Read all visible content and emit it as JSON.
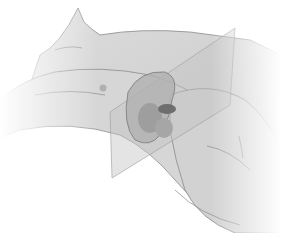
{
  "image": {
    "subject": "anatomical illustration of reclining torso with translucent cross-section planes",
    "width": 281,
    "height": 233,
    "background": "#ffffff",
    "colors": {
      "skin": "#d4d4d4",
      "skin_shadow": "#b8b8b8",
      "outline": "#8a8a8a",
      "plane": "#c8c8c8",
      "organ": "#a8a8a8",
      "organ_dark": "#6e6e6e"
    }
  }
}
